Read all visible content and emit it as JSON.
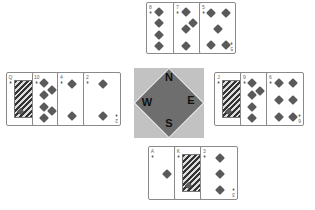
{
  "compass": {
    "n": "N",
    "e": "E",
    "s": "S",
    "w": "W"
  },
  "colors": {
    "pip": "#5a5a5a",
    "compass_bg": "#c2c2c2",
    "compass_diamond": "#6e6e6e"
  },
  "hands": {
    "north": [
      {
        "rank": "8",
        "suit": "diamonds",
        "suit_icon": "♦"
      },
      {
        "rank": "7",
        "suit": "diamonds",
        "suit_icon": "♦"
      },
      {
        "rank": "5",
        "suit": "diamonds",
        "suit_icon": "♦"
      }
    ],
    "west": [
      {
        "rank": "Q",
        "suit": "diamonds",
        "suit_icon": "♦"
      },
      {
        "rank": "10",
        "suit": "diamonds",
        "suit_icon": "♦"
      },
      {
        "rank": "4",
        "suit": "diamonds",
        "suit_icon": "♦"
      },
      {
        "rank": "2",
        "suit": "diamonds",
        "suit_icon": "♦"
      }
    ],
    "east": [
      {
        "rank": "J",
        "suit": "diamonds",
        "suit_icon": "♦"
      },
      {
        "rank": "9",
        "suit": "diamonds",
        "suit_icon": "♦"
      },
      {
        "rank": "6",
        "suit": "diamonds",
        "suit_icon": "♦"
      }
    ],
    "south": [
      {
        "rank": "A",
        "suit": "diamonds",
        "suit_icon": "♦"
      },
      {
        "rank": "K",
        "suit": "diamonds",
        "suit_icon": "♦"
      },
      {
        "rank": "3",
        "suit": "diamonds",
        "suit_icon": "♦"
      }
    ]
  }
}
